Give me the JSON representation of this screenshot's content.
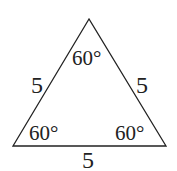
{
  "diagram": {
    "shape": "equilateral triangle",
    "stroke_color": "#222222",
    "vertices": {
      "apex": [
        89,
        19
      ],
      "bottom_left": [
        13,
        146
      ],
      "bottom_right": [
        166,
        146
      ]
    },
    "angles": {
      "apex": "60°",
      "bottom_left": "60°",
      "bottom_right": "60°"
    },
    "sides": {
      "left": "5",
      "right": "5",
      "bottom": "5"
    }
  }
}
